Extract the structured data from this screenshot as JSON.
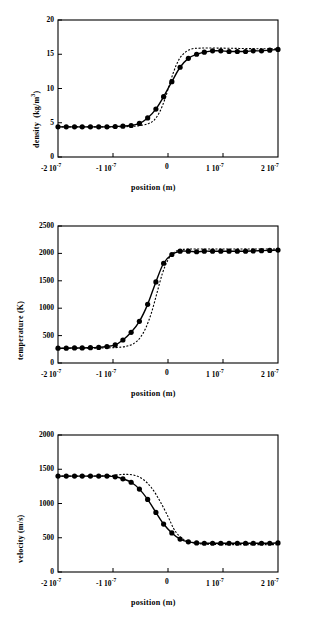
{
  "figure": {
    "panels": [
      {
        "id": "density-panel",
        "ylabel": "density",
        "yunit": "(kg/m",
        "yunit_exp": "3",
        "yunit_close": ")",
        "xlabel": "position  (m)",
        "ytick_labels": [
          "0",
          "5",
          "10",
          "15",
          "20"
        ],
        "xtick_labels": [
          "-2",
          "-1",
          "0",
          "1",
          "2"
        ],
        "xtick_exp": [
          "10",
          "10",
          "",
          "10",
          "10"
        ],
        "xtick_sup": [
          "-7",
          "-7",
          "",
          "-7",
          "-7"
        ]
      },
      {
        "id": "temperature-panel",
        "ylabel": "temperature  (K)",
        "xlabel": "position  (m)",
        "ytick_labels": [
          "0",
          "500",
          "1000",
          "1500",
          "2000",
          "2500"
        ],
        "xtick_labels": [
          "-2",
          "-1",
          "0",
          "1",
          "2"
        ]
      },
      {
        "id": "velocity-panel",
        "ylabel": "velocity  (m/s)",
        "xlabel": "position  (m)",
        "ytick_labels": [
          "0",
          "500",
          "1000",
          "1500",
          "2000"
        ],
        "xtick_labels": [
          "-2",
          "-1",
          "0",
          "1",
          "2"
        ]
      }
    ]
  },
  "chart_data": [
    {
      "type": "line",
      "id": "density",
      "title": "",
      "xlabel": "position  (m)",
      "ylabel": "density  (kg/m^3)",
      "xlim": [
        -2e-07,
        2e-07
      ],
      "ylim": [
        0,
        20
      ],
      "xticks": [
        -2e-07,
        -1e-07,
        0,
        1e-07,
        2e-07
      ],
      "xticklabels": [
        "-2 10^-7",
        "-1 10^-7",
        "0",
        "1 10^-7",
        "2 10^-7"
      ],
      "yticks": [
        0,
        5,
        10,
        15,
        20
      ],
      "yticklabels": [
        "0",
        "5",
        "10",
        "15",
        "20"
      ],
      "grid": false,
      "legend": false,
      "series": [
        {
          "name": "simulation (solid line with filled circles)",
          "style": "solid-with-markers",
          "marker": "filled-circle",
          "x": [
            -2e-07,
            -1.85e-07,
            -1.7e-07,
            -1.56e-07,
            -1.41e-07,
            -1.26e-07,
            -1.11e-07,
            -9.6e-08,
            -8.2e-08,
            -6.7e-08,
            -5.2e-08,
            -3.7e-08,
            -2.2e-08,
            -8e-09,
            7e-09,
            2.2e-08,
            3.7e-08,
            5.2e-08,
            6.6e-08,
            8.1e-08,
            9.6e-08,
            1.11e-07,
            1.26e-07,
            1.41e-07,
            1.55e-07,
            1.7e-07,
            1.85e-07,
            2e-07
          ],
          "y": [
            4.4,
            4.4,
            4.4,
            4.4,
            4.4,
            4.4,
            4.4,
            4.45,
            4.5,
            4.6,
            4.9,
            5.7,
            7.0,
            8.8,
            11.0,
            13.1,
            14.4,
            15.0,
            15.3,
            15.5,
            15.5,
            15.4,
            15.4,
            15.4,
            15.5,
            15.5,
            15.6,
            15.7
          ]
        },
        {
          "name": "theory (dotted line)",
          "style": "dotted",
          "marker": "none",
          "x": [
            -2e-07,
            -1.5e-07,
            -1e-07,
            -7e-08,
            -5e-08,
            -3.5e-08,
            -2.5e-08,
            -1.5e-08,
            -5e-09,
            5e-09,
            1.5e-08,
            2.5e-08,
            4e-08,
            6e-08,
            9e-08,
            1.3e-07,
            1.7e-07,
            2e-07
          ],
          "y": [
            4.4,
            4.4,
            4.4,
            4.45,
            4.6,
            4.9,
            5.4,
            6.6,
            8.6,
            11.2,
            13.4,
            14.8,
            15.7,
            15.9,
            15.9,
            15.85,
            15.8,
            15.8
          ]
        }
      ]
    },
    {
      "type": "line",
      "id": "temperature",
      "title": "",
      "xlabel": "position  (m)",
      "ylabel": "temperature  (K)",
      "xlim": [
        -2e-07,
        2e-07
      ],
      "ylim": [
        0,
        2500
      ],
      "xticks": [
        -2e-07,
        -1e-07,
        0,
        1e-07,
        2e-07
      ],
      "xticklabels": [
        "-2 10^-7",
        "-1 10^-7",
        "0",
        "1 10^-7",
        "2 10^-7"
      ],
      "yticks": [
        0,
        500,
        1000,
        1500,
        2000,
        2500
      ],
      "yticklabels": [
        "0",
        "500",
        "1000",
        "1500",
        "2000",
        "2500"
      ],
      "grid": false,
      "legend": false,
      "series": [
        {
          "name": "simulation (solid line with filled circles)",
          "style": "solid-with-markers",
          "marker": "filled-circle",
          "x": [
            -2e-07,
            -1.85e-07,
            -1.7e-07,
            -1.56e-07,
            -1.41e-07,
            -1.26e-07,
            -1.11e-07,
            -9.6e-08,
            -8.2e-08,
            -6.7e-08,
            -5.2e-08,
            -3.7e-08,
            -2.2e-08,
            -8e-09,
            7e-09,
            2.2e-08,
            3.7e-08,
            5.2e-08,
            6.6e-08,
            8.1e-08,
            9.6e-08,
            1.11e-07,
            1.26e-07,
            1.41e-07,
            1.55e-07,
            1.7e-07,
            1.85e-07,
            2e-07
          ],
          "y": [
            270,
            270,
            275,
            275,
            280,
            285,
            300,
            330,
            420,
            560,
            760,
            1070,
            1480,
            1820,
            1980,
            2040,
            2040,
            2030,
            2040,
            2040,
            2040,
            2040,
            2040,
            2040,
            2045,
            2050,
            2055,
            2060
          ]
        },
        {
          "name": "theory (dotted line)",
          "style": "dotted",
          "marker": "none",
          "x": [
            -2e-07,
            -1.5e-07,
            -1.1e-07,
            -8.5e-08,
            -7e-08,
            -6e-08,
            -5e-08,
            -4e-08,
            -3e-08,
            -2e-08,
            -1e-08,
            0.0,
            1e-08,
            2.5e-08,
            5e-08,
            1e-07,
            1.5e-07,
            2e-07
          ],
          "y": [
            270,
            270,
            275,
            290,
            320,
            370,
            470,
            650,
            920,
            1280,
            1640,
            1880,
            2010,
            2070,
            2080,
            2080,
            2080,
            2080
          ]
        }
      ]
    },
    {
      "type": "line",
      "id": "velocity",
      "title": "",
      "xlabel": "position  (m)",
      "ylabel": "velocity  (m/s)",
      "xlim": [
        -2e-07,
        2e-07
      ],
      "ylim": [
        0,
        2000
      ],
      "xticks": [
        -2e-07,
        -1e-07,
        0,
        1e-07,
        2e-07
      ],
      "xticklabels": [
        "-2 10^-7",
        "-1 10^-7",
        "0",
        "1 10^-7",
        "2 10^-7"
      ],
      "yticks": [
        0,
        500,
        1000,
        1500,
        2000
      ],
      "yticklabels": [
        "0",
        "500",
        "1000",
        "1500",
        "2000"
      ],
      "grid": false,
      "legend": false,
      "series": [
        {
          "name": "simulation (solid line with filled circles)",
          "style": "solid-with-markers",
          "marker": "filled-circle",
          "x": [
            -2e-07,
            -1.85e-07,
            -1.7e-07,
            -1.56e-07,
            -1.41e-07,
            -1.26e-07,
            -1.11e-07,
            -9.6e-08,
            -8.2e-08,
            -6.7e-08,
            -5.2e-08,
            -3.7e-08,
            -2.2e-08,
            -8e-09,
            7e-09,
            2.2e-08,
            3.7e-08,
            5.2e-08,
            6.6e-08,
            8.1e-08,
            9.6e-08,
            1.11e-07,
            1.26e-07,
            1.41e-07,
            1.55e-07,
            1.7e-07,
            1.85e-07,
            2e-07
          ],
          "y": [
            1400,
            1400,
            1400,
            1400,
            1400,
            1400,
            1400,
            1390,
            1360,
            1310,
            1210,
            1060,
            870,
            700,
            570,
            480,
            440,
            425,
            420,
            420,
            420,
            420,
            420,
            420,
            420,
            420,
            420,
            425
          ]
        },
        {
          "name": "theory (dotted line)",
          "style": "dotted",
          "marker": "none",
          "x": [
            -2e-07,
            -1.5e-07,
            -1.1e-07,
            -9e-08,
            -7.5e-08,
            -6e-08,
            -4.5e-08,
            -3e-08,
            -1.5e-08,
            0.0,
            1e-08,
            2e-08,
            3.5e-08,
            6e-08,
            1e-07,
            1.5e-07,
            2e-07
          ],
          "y": [
            1400,
            1400,
            1405,
            1420,
            1425,
            1410,
            1350,
            1230,
            1040,
            810,
            640,
            530,
            450,
            410,
            400,
            400,
            400
          ]
        }
      ]
    }
  ]
}
